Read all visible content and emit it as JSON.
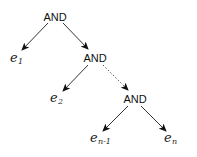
{
  "diagram": {
    "type": "binary-tree",
    "nodes": {
      "and_root": {
        "label": "AND"
      },
      "and_mid": {
        "label": "AND"
      },
      "and_bottom": {
        "label": "AND"
      },
      "e1": {
        "base": "e",
        "sub": "1"
      },
      "e2": {
        "base": "e",
        "sub": "2"
      },
      "en_minus_1": {
        "base": "e",
        "sub": "n-1"
      },
      "en": {
        "base": "e",
        "sub": "n"
      }
    },
    "edges": [
      {
        "from": "and_root",
        "to": "e1",
        "style": "solid"
      },
      {
        "from": "and_root",
        "to": "and_mid",
        "style": "solid"
      },
      {
        "from": "and_mid",
        "to": "e2",
        "style": "solid"
      },
      {
        "from": "and_mid",
        "to": "and_bottom",
        "style": "dotted"
      },
      {
        "from": "and_bottom",
        "to": "en_minus_1",
        "style": "solid"
      },
      {
        "from": "and_bottom",
        "to": "en",
        "style": "solid"
      }
    ],
    "colors": {
      "edge": "#333333",
      "text": "#111111",
      "background": "#ffffff"
    }
  }
}
